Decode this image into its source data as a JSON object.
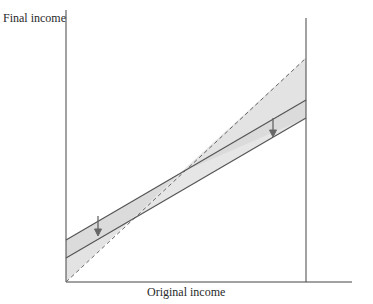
{
  "diagram": {
    "y_axis_label": "Final income",
    "x_axis_label": "Original income",
    "colors": {
      "axis": "#444444",
      "line": "#555555",
      "shade": "#e3e3e3",
      "arrow": "#666666"
    },
    "lines": [
      {
        "name": "45-degree line (no redistribution)",
        "style": "dashed",
        "from": [
          66,
          282
        ],
        "to": [
          306,
          58
        ]
      },
      {
        "name": "final income before tax",
        "style": "solid",
        "from": [
          66,
          240
        ],
        "to": [
          306,
          100
        ]
      },
      {
        "name": "final income after tax",
        "style": "solid",
        "from": [
          66,
          258
        ],
        "to": [
          306,
          118
        ]
      }
    ],
    "arrows": [
      {
        "position": "left",
        "direction": "down"
      },
      {
        "position": "right",
        "direction": "down"
      }
    ],
    "vertical_marker_x": 306
  }
}
